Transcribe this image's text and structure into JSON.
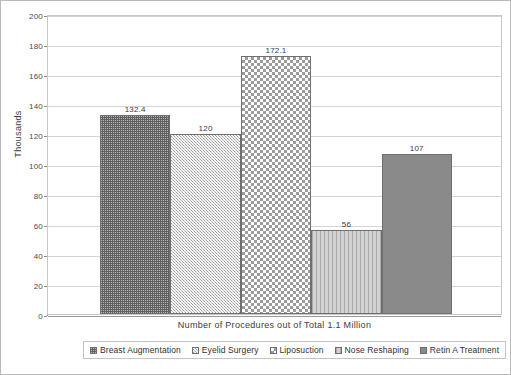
{
  "chart_data": {
    "type": "bar",
    "title": "",
    "subtitle": "",
    "xlabel": "Number of Procedures out of Total 1.1 Million",
    "ylabel": "Thousands",
    "ylim": [
      0,
      200
    ],
    "ytick_step": 20,
    "yticks": [
      "200",
      "180",
      "160",
      "140",
      "120",
      "100",
      "80",
      "60",
      "40",
      "20",
      "0"
    ],
    "grid": true,
    "legend_position": "bottom",
    "categories": [
      "Breast Augmentation",
      "Eyelid Surgery",
      "Liposuction",
      "Nose Reshaping",
      "Retin A Treatment"
    ],
    "values": [
      132.4,
      120,
      172.1,
      56,
      107
    ],
    "data_labels": [
      "132.4",
      "120",
      "172.1",
      "56",
      "107"
    ],
    "bars": [
      {
        "category": "Breast Augmentation",
        "value": 132.4,
        "label": "132.4",
        "pattern": "dotted-dark-grey",
        "color": "#606060"
      },
      {
        "category": "Eyelid Surgery",
        "value": 120,
        "label": "120",
        "pattern": "woven-light-grey",
        "color": "#c5c5c5"
      },
      {
        "category": "Liposuction",
        "value": 172.1,
        "label": "172.1",
        "pattern": "checkerboard",
        "color": "#9b9b9b"
      },
      {
        "category": "Nose Reshaping",
        "value": 56,
        "label": "56",
        "pattern": "vertical-stripes",
        "color": "#d2d2d2"
      },
      {
        "category": "Retin A Treatment",
        "value": 107,
        "label": "107",
        "pattern": "solid-grey",
        "color": "#8a8a8a"
      }
    ]
  },
  "legend": {
    "items": [
      {
        "label": "Breast Augmentation"
      },
      {
        "label": "Eyelid Surgery"
      },
      {
        "label": "Liposuction"
      },
      {
        "label": "Nose Reshaping"
      },
      {
        "label": "Retin A Treatment"
      }
    ]
  },
  "axes": {
    "y_title": "Thousands",
    "x_title": "Number of Procedures out of Total 1.1 Million"
  }
}
